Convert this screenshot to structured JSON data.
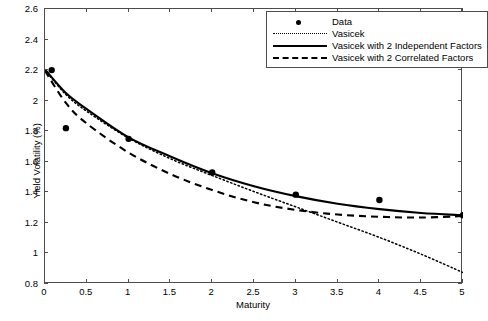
{
  "chart_data": {
    "type": "line",
    "title": "",
    "xlabel": "Maturity",
    "ylabel": "Yield Volatility (%)",
    "xlim": [
      0,
      5
    ],
    "ylim": [
      0.8,
      2.6
    ],
    "xticks": [
      "0",
      "0.5",
      "1",
      "1.5",
      "2",
      "2.5",
      "3",
      "3.5",
      "4",
      "4.5",
      "5"
    ],
    "yticks": [
      "0.8",
      "1",
      "1.2",
      "1.4",
      "1.6",
      "1.8",
      "2",
      "2.2",
      "2.4",
      "2.6"
    ],
    "grid": false,
    "legend_position": "top-right",
    "legend": [
      {
        "label": "Data",
        "style": "marker"
      },
      {
        "label": "Vasicek",
        "style": "dotted"
      },
      {
        "label": "Vasicek with 2 Independent Factors",
        "style": "solid"
      },
      {
        "label": "Vasicek with 2 Correlated Factors",
        "style": "dashed"
      }
    ],
    "series": [
      {
        "name": "Data",
        "style": "marker",
        "points": [
          {
            "x": 0.08,
            "y": 2.2
          },
          {
            "x": 0.25,
            "y": 1.82
          },
          {
            "x": 1.0,
            "y": 1.75
          },
          {
            "x": 2.0,
            "y": 1.53
          },
          {
            "x": 3.0,
            "y": 1.385
          },
          {
            "x": 4.0,
            "y": 1.35
          },
          {
            "x": 5.0,
            "y": 1.25
          }
        ]
      },
      {
        "name": "Vasicek",
        "style": "dotted",
        "points": [
          {
            "x": 0.0,
            "y": 2.2
          },
          {
            "x": 0.25,
            "y": 2.04
          },
          {
            "x": 0.5,
            "y": 1.93
          },
          {
            "x": 1.0,
            "y": 1.755
          },
          {
            "x": 1.5,
            "y": 1.62
          },
          {
            "x": 2.0,
            "y": 1.51
          },
          {
            "x": 2.5,
            "y": 1.405
          },
          {
            "x": 3.0,
            "y": 1.305
          },
          {
            "x": 3.5,
            "y": 1.205
          },
          {
            "x": 4.0,
            "y": 1.105
          },
          {
            "x": 4.5,
            "y": 0.995
          },
          {
            "x": 5.0,
            "y": 0.875
          }
        ]
      },
      {
        "name": "Vasicek with 2 Independent Factors",
        "style": "solid",
        "points": [
          {
            "x": 0.0,
            "y": 2.205
          },
          {
            "x": 0.25,
            "y": 2.05
          },
          {
            "x": 0.5,
            "y": 1.945
          },
          {
            "x": 1.0,
            "y": 1.76
          },
          {
            "x": 1.5,
            "y": 1.635
          },
          {
            "x": 2.0,
            "y": 1.525
          },
          {
            "x": 2.5,
            "y": 1.44
          },
          {
            "x": 3.0,
            "y": 1.375
          },
          {
            "x": 3.5,
            "y": 1.325
          },
          {
            "x": 4.0,
            "y": 1.29
          },
          {
            "x": 4.5,
            "y": 1.265
          },
          {
            "x": 5.0,
            "y": 1.25
          }
        ]
      },
      {
        "name": "Vasicek with 2 Correlated Factors",
        "style": "dashed",
        "points": [
          {
            "x": 0.0,
            "y": 2.195
          },
          {
            "x": 0.25,
            "y": 1.985
          },
          {
            "x": 0.5,
            "y": 1.85
          },
          {
            "x": 1.0,
            "y": 1.66
          },
          {
            "x": 1.5,
            "y": 1.52
          },
          {
            "x": 2.0,
            "y": 1.415
          },
          {
            "x": 2.5,
            "y": 1.335
          },
          {
            "x": 3.0,
            "y": 1.285
          },
          {
            "x": 3.5,
            "y": 1.255
          },
          {
            "x": 4.0,
            "y": 1.24
          },
          {
            "x": 4.5,
            "y": 1.235
          },
          {
            "x": 5.0,
            "y": 1.245
          }
        ]
      }
    ]
  }
}
